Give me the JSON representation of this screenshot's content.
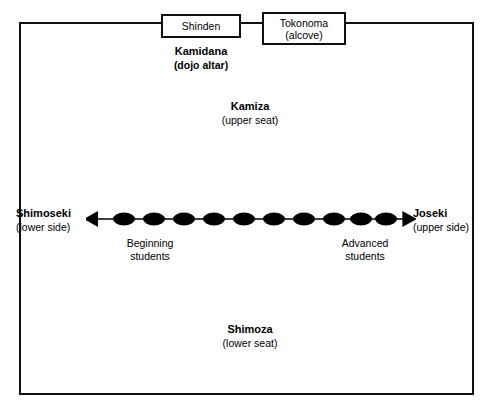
{
  "diagram": {
    "frame": {
      "name": "dojo-floor"
    },
    "fixtures": [
      {
        "id": "shinden",
        "lines": [
          "Shinden"
        ]
      },
      {
        "id": "tokonoma",
        "lines": [
          "Tokonoma",
          "(alcove)"
        ]
      }
    ],
    "labels": {
      "kamidana": {
        "main": "Kamidana",
        "sub": "(dojo altar)"
      },
      "kamiza": {
        "main": "Kamiza",
        "sub": "(upper seat)"
      },
      "shimoza": {
        "main": "Shimoza",
        "sub": "(lower seat)"
      },
      "shimoseki": {
        "main": "Shimoseki",
        "sub": "(lower side)"
      },
      "joseki": {
        "main": "Joseki",
        "sub": "(upper side)"
      }
    },
    "continuum": {
      "left_end_label_line1": "Beginning",
      "left_end_label_line2": "students",
      "right_end_label_line1": "Advanced",
      "right_end_label_line2": "students",
      "student_count": 10,
      "arrow_direction": "double",
      "marker_shape": "filled-ellipse",
      "marker_color": "#000000",
      "line_color": "#000000"
    },
    "colors": {
      "stroke": "#111111",
      "text": "#000000",
      "background": "#ffffff"
    }
  }
}
